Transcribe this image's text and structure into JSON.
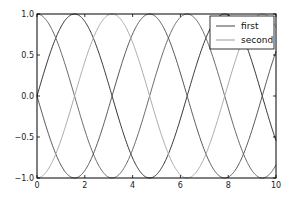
{
  "chart_data": {
    "type": "line",
    "title": "",
    "xlabel": "",
    "ylabel": "",
    "xlim": [
      0,
      10
    ],
    "ylim": [
      -1.0,
      1.0
    ],
    "grid": false,
    "legend_position": "upper right",
    "x_ticks": [
      0,
      2,
      4,
      6,
      8,
      10
    ],
    "x_tick_labels": [
      "0",
      "2",
      "4",
      "6",
      "8",
      "10"
    ],
    "y_ticks": [
      1.0,
      0.5,
      0.0,
      -0.5,
      -1.0
    ],
    "y_tick_labels": [
      "1.0",
      "0.5",
      "0.0",
      "−0.5",
      "−1.0"
    ],
    "legend": [
      {
        "label": "first",
        "color": "#444444"
      },
      {
        "label": "second",
        "color": "#999999"
      }
    ],
    "series": [
      {
        "name": "first",
        "function": "sin(x)",
        "color": "#333333"
      },
      {
        "name": "second",
        "function": "cos(x)",
        "color": "#666666"
      },
      {
        "name": "",
        "function": "-sin(x)",
        "color": "#555555"
      },
      {
        "name": "",
        "function": "-cos(x)",
        "color": "#aaaaaa"
      }
    ]
  }
}
